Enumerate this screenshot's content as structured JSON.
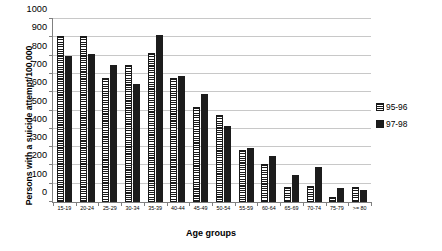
{
  "chart_data": {
    "type": "bar",
    "title": "",
    "xlabel": "Age groups",
    "ylabel": "Persons with a suicide attempt/100,000",
    "ylim": [
      0,
      1000
    ],
    "ytick_step": 100,
    "grid": true,
    "legend_position": "right",
    "categories": [
      "15-19",
      "20-24",
      "25-29",
      "30-34",
      "35-39",
      "40-44",
      "45-49",
      "50-54",
      "55-59",
      "60-64",
      "65-69",
      "70-74",
      "75-79",
      ">= 80"
    ],
    "yticks": [
      "0",
      "100",
      "200",
      "300",
      "400",
      "500",
      "600",
      "700",
      "800",
      "900",
      "1000"
    ],
    "series": [
      {
        "name": "95-96",
        "style": "horizontal-hatch",
        "values": [
          905,
          905,
          675,
          750,
          815,
          675,
          520,
          475,
          285,
          210,
          80,
          85,
          30,
          80
        ]
      },
      {
        "name": "97-98",
        "style": "solid-black",
        "values": [
          800,
          810,
          750,
          645,
          910,
          690,
          590,
          415,
          295,
          250,
          145,
          190,
          75,
          65
        ]
      }
    ]
  },
  "legend": {
    "items": [
      {
        "label": "95-96"
      },
      {
        "label": "97-98"
      }
    ]
  },
  "colors": {
    "series_95_96": "#ffffff",
    "series_97_98": "#1c1c1c",
    "gridline": "#c8c8c8",
    "axis": "#808080",
    "text": "#000000",
    "background": "#ffffff"
  }
}
